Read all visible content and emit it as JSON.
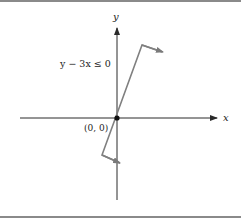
{
  "diagram": {
    "title": "",
    "axes": {
      "x_label": "x",
      "y_label": "y"
    },
    "origin_label": "(0, 0)",
    "inequality_label": "y − 3x ≤ 0",
    "boundary_line": {
      "equation": "y = 3x",
      "passes_through": "(0, 0)"
    },
    "shaded_side_indicator": "arrows point toward region below/right of line",
    "colors": {
      "axes": "#2a2a2a",
      "boundary_line": "#808080",
      "text": "#222222",
      "frame_border": "#8a8a8a"
    }
  }
}
